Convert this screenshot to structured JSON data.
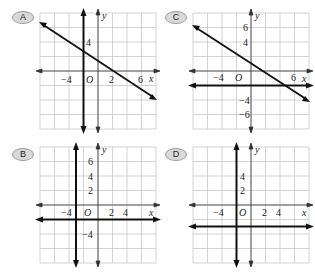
{
  "choices": [
    {
      "id": "A",
      "label": "A",
      "x_axis_label": "x",
      "y_axis_label": "y",
      "origin_label": "O",
      "x_tick_labels": [
        "-4",
        "2",
        "6"
      ],
      "y_tick_labels": [
        "4"
      ],
      "lines": [
        {
          "type": "vertical",
          "equation": "x = -2"
        },
        {
          "type": "linear",
          "description": "decreasing line crossing x-axis at 2",
          "from": [
            -8,
            6.5
          ],
          "to": [
            8,
            -4
          ]
        }
      ]
    },
    {
      "id": "C",
      "label": "C",
      "x_axis_label": "x",
      "y_axis_label": "y",
      "origin_label": "O",
      "x_tick_labels": [
        "-4",
        "6"
      ],
      "y_tick_labels": [
        "6",
        "4",
        "-4",
        "-6"
      ],
      "lines": [
        {
          "type": "horizontal",
          "equation": "y = -2"
        },
        {
          "type": "linear",
          "description": "decreasing line crossing x-axis near 3",
          "from": [
            -8,
            6
          ],
          "to": [
            8,
            -4
          ]
        }
      ]
    },
    {
      "id": "B",
      "label": "B",
      "x_axis_label": "x",
      "y_axis_label": "y",
      "origin_label": "O",
      "x_tick_labels": [
        "-4",
        "2",
        "4"
      ],
      "y_tick_labels": [
        "6",
        "4",
        "2",
        "-4"
      ],
      "lines": [
        {
          "type": "vertical",
          "equation": "x = -3"
        },
        {
          "type": "horizontal",
          "equation": "y = -2"
        }
      ]
    },
    {
      "id": "D",
      "label": "D",
      "x_axis_label": "x",
      "y_axis_label": "y",
      "origin_label": "O",
      "x_tick_labels": [
        "-4",
        "2",
        "4"
      ],
      "y_tick_labels": [
        "4",
        "2"
      ],
      "lines": [
        {
          "type": "vertical",
          "equation": "x = -2"
        },
        {
          "type": "horizontal",
          "equation": "y = -3"
        }
      ]
    }
  ]
}
